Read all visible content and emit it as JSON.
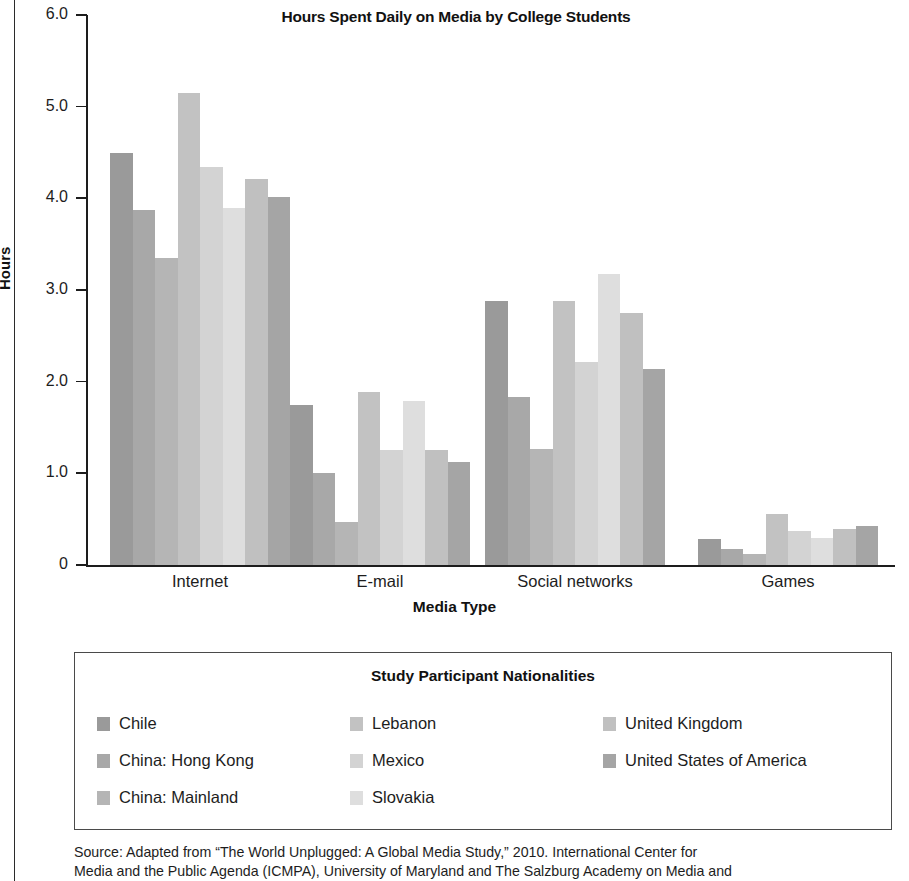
{
  "chart_data": {
    "type": "bar",
    "title": "Hours Spent Daily on Media by College Students",
    "xlabel": "Media Type",
    "ylabel": "Hours",
    "ylim": [
      0,
      6
    ],
    "yticks": [
      "0",
      "1.0",
      "2.0",
      "3.0",
      "4.0",
      "5.0",
      "6.0"
    ],
    "ytick_values": [
      0,
      1,
      2,
      3,
      4,
      5,
      6
    ],
    "grid": false,
    "legend_position": "below-plot",
    "categories": [
      "Internet",
      "E-mail",
      "Social networks",
      "Games"
    ],
    "series": [
      {
        "name": "Chile",
        "color": "#9a9a9a",
        "values": [
          4.5,
          1.75,
          2.88,
          0.28
        ]
      },
      {
        "name": "China: Hong Kong",
        "color": "#a8a8a8",
        "values": [
          3.87,
          1.0,
          1.83,
          0.17
        ]
      },
      {
        "name": "China: Mainland",
        "color": "#b5b5b5",
        "values": [
          3.35,
          0.47,
          1.27,
          0.12
        ]
      },
      {
        "name": "Lebanon",
        "color": "#c2c2c2",
        "values": [
          5.15,
          1.89,
          2.88,
          0.56
        ]
      },
      {
        "name": "Mexico",
        "color": "#d3d3d3",
        "values": [
          4.34,
          1.25,
          2.21,
          0.37
        ]
      },
      {
        "name": "Slovakia",
        "color": "#dedede",
        "values": [
          3.89,
          1.79,
          3.17,
          0.3
        ]
      },
      {
        "name": "United Kingdom",
        "color": "#c0c0c0",
        "values": [
          4.21,
          1.25,
          2.75,
          0.39
        ]
      },
      {
        "name": "United States of America",
        "color": "#a5a5a5",
        "values": [
          4.01,
          1.12,
          2.14,
          0.43
        ]
      }
    ]
  },
  "legend": {
    "title": "Study Participant Nationalities",
    "columns": [
      [
        "Chile",
        "China: Hong Kong",
        "China: Mainland"
      ],
      [
        "Lebanon",
        "Mexico",
        "Slovakia"
      ],
      [
        "United Kingdom",
        "United States of America"
      ]
    ]
  },
  "source": {
    "label": "Source:",
    "line1": "Adapted from “The World Unplugged: A Global Media Study,” 2010. International Center for",
    "line2": "Media and the Public Agenda (ICMPA), University of Maryland and The Salzburg Academy on Media and"
  }
}
